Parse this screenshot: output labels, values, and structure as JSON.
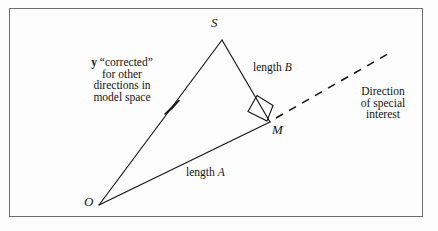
{
  "figure": {
    "type": "geometry-diagram",
    "background_color": "#fdfdfd",
    "frame_color": "#6e6e6e",
    "ink_color": "#131313"
  },
  "vertices": {
    "origin": {
      "label": "O",
      "x": 99,
      "y": 205
    },
    "apex": {
      "label": "S",
      "x": 222,
      "y": 40
    },
    "foot": {
      "label": "M",
      "x": 270,
      "y": 122
    }
  },
  "vertex_labels": {
    "origin": "O",
    "apex": "S",
    "foot": "M"
  },
  "segment_labels": {
    "side_a_prefix": "length ",
    "side_a_symbol": "A",
    "side_b_prefix": "length ",
    "side_b_symbol": "B"
  },
  "annotations": {
    "corrected_vector": {
      "lines": [
        "y “corrected”",
        "for other",
        "directions in",
        "model space"
      ],
      "bold_symbol": "y",
      "line1_rest": " “corrected”",
      "line2": "for other",
      "line3": "directions in",
      "line4": "model space"
    },
    "direction": {
      "lines": [
        "Direction",
        "of special",
        "interest"
      ],
      "line1": "Direction",
      "line2": "of special",
      "line3": "interest"
    }
  },
  "marks": {
    "right_angle": "right-angle-square",
    "arrowhead": "arrowhead-on-OS"
  }
}
